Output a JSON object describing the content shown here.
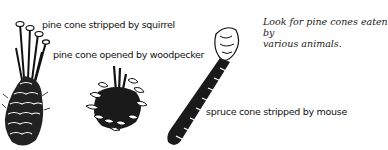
{
  "caption": {
    "line1": "Look for pine cones eaten by",
    "line2": "various animals."
  },
  "labels": {
    "squirrel": "pine cone stripped by squirrel",
    "woodpecker": "pine cone opened by woodpecker",
    "mouse": "spruce cone stripped by mouse"
  },
  "illustrations": [
    {
      "name": "squirrel-stripped-pine-cone"
    },
    {
      "name": "woodpecker-opened-pine-cone"
    },
    {
      "name": "mouse-stripped-spruce-cone"
    }
  ]
}
